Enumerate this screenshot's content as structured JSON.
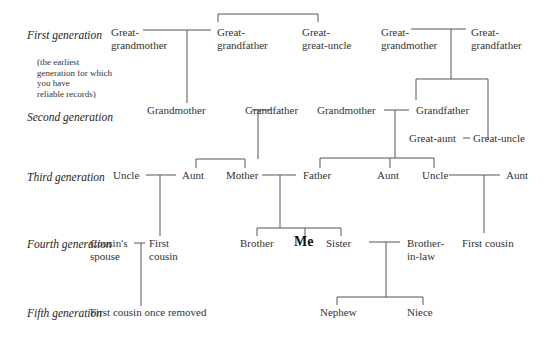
{
  "generations": [
    {
      "label": "First\ngeneration",
      "note": "(the earliest\ngeneration for which\nyou have\nreliable records)"
    },
    {
      "label": "Second\ngeneration"
    },
    {
      "label": "Third\ngeneration"
    },
    {
      "label": "Fourth\ngeneration"
    },
    {
      "label": "Fifth\ngeneration"
    }
  ],
  "nodes": {
    "ggm_left": "Great-\ngrandmother",
    "ggf_left": "Great-\ngrandfather",
    "gg_uncle": "Great-\ngreat-uncle",
    "ggm_right": "Great-\ngrandmother",
    "ggf_right": "Great-\ngrandfather",
    "gm_left": "Grandmother",
    "gf_left": "Grandfather",
    "gm_right": "Grandmother",
    "gf_right": "Grandfather",
    "great_aunt": "Great-aunt",
    "great_uncle": "Great-uncle",
    "uncle_left": "Uncle",
    "aunt_left": "Aunt",
    "mother": "Mother",
    "father": "Father",
    "aunt_mid": "Aunt",
    "uncle_right": "Uncle",
    "aunt_right": "Aunt",
    "cousin_spouse": "Cousin's\nspouse",
    "first_cousin_left": "First\ncousin",
    "brother": "Brother",
    "me": "Me",
    "sister": "Sister",
    "brother_in_law": "Brother-\nin-law",
    "first_cousin_right": "First cousin",
    "first_cousin_once_removed": "First cousin once removed",
    "nephew": "Nephew",
    "niece": "Niece"
  }
}
